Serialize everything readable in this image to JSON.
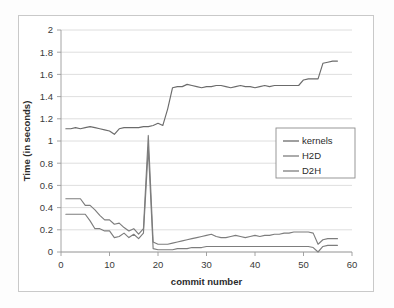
{
  "chart_data": {
    "type": "line",
    "title": "",
    "xlabel": "commit number",
    "ylabel": "Time (in seconds)",
    "xlim": [
      0,
      60
    ],
    "ylim": [
      0,
      2
    ],
    "xticks": [
      0,
      10,
      20,
      30,
      40,
      50,
      60
    ],
    "yticks": [
      0,
      0.2,
      0.4,
      0.6,
      0.8,
      1,
      1.2,
      1.4,
      1.6,
      1.8,
      2
    ],
    "xtick_labels": [
      "0",
      "10",
      "20",
      "30",
      "40",
      "50",
      "60"
    ],
    "ytick_labels": [
      "0",
      "0.2",
      "0.4",
      "0.6",
      "0.8",
      "1",
      "1.2",
      "1.4",
      "1.6",
      "1.8",
      "2"
    ],
    "grid": "horizontal",
    "legend_position": "center-right",
    "x": [
      1,
      2,
      3,
      4,
      5,
      6,
      7,
      8,
      9,
      10,
      11,
      12,
      13,
      14,
      15,
      16,
      17,
      18,
      19,
      20,
      21,
      22,
      23,
      24,
      25,
      26,
      27,
      28,
      29,
      30,
      31,
      32,
      33,
      34,
      35,
      36,
      37,
      38,
      39,
      40,
      41,
      42,
      43,
      44,
      45,
      46,
      47,
      48,
      49,
      50,
      51,
      52,
      53,
      54,
      55,
      56,
      57
    ],
    "series": [
      {
        "name": "kernels",
        "color": "#6b6b6b",
        "values": [
          1.11,
          1.11,
          1.12,
          1.11,
          1.12,
          1.13,
          1.12,
          1.11,
          1.1,
          1.09,
          1.06,
          1.11,
          1.12,
          1.12,
          1.12,
          1.12,
          1.13,
          1.13,
          1.14,
          1.16,
          1.14,
          1.29,
          1.48,
          1.49,
          1.49,
          1.51,
          1.5,
          1.49,
          1.48,
          1.49,
          1.49,
          1.5,
          1.5,
          1.49,
          1.48,
          1.49,
          1.5,
          1.49,
          1.49,
          1.48,
          1.49,
          1.5,
          1.49,
          1.5,
          1.5,
          1.5,
          1.5,
          1.5,
          1.5,
          1.55,
          1.56,
          1.56,
          1.56,
          1.7,
          1.71,
          1.72,
          1.72
        ]
      },
      {
        "name": "H2D",
        "color": "#7d7d7d",
        "values": [
          0.48,
          0.48,
          0.48,
          0.48,
          0.42,
          0.42,
          0.38,
          0.33,
          0.29,
          0.29,
          0.25,
          0.26,
          0.22,
          0.19,
          0.21,
          0.16,
          0.21,
          1.05,
          0.09,
          0.07,
          0.07,
          0.07,
          0.08,
          0.09,
          0.1,
          0.11,
          0.12,
          0.13,
          0.14,
          0.15,
          0.16,
          0.14,
          0.13,
          0.13,
          0.14,
          0.15,
          0.14,
          0.13,
          0.14,
          0.15,
          0.14,
          0.15,
          0.15,
          0.16,
          0.16,
          0.17,
          0.17,
          0.18,
          0.18,
          0.18,
          0.18,
          0.17,
          0.07,
          0.11,
          0.12,
          0.12,
          0.12
        ]
      },
      {
        "name": "D2H",
        "color": "#7d7d7d",
        "values": [
          0.34,
          0.34,
          0.34,
          0.34,
          0.34,
          0.28,
          0.21,
          0.21,
          0.19,
          0.19,
          0.13,
          0.14,
          0.17,
          0.13,
          0.16,
          0.12,
          0.17,
          0.94,
          0.03,
          0.02,
          0.02,
          0.02,
          0.02,
          0.03,
          0.03,
          0.03,
          0.04,
          0.04,
          0.04,
          0.05,
          0.05,
          0.05,
          0.05,
          0.05,
          0.05,
          0.05,
          0.05,
          0.05,
          0.05,
          0.05,
          0.05,
          0.05,
          0.05,
          0.05,
          0.05,
          0.05,
          0.05,
          0.05,
          0.05,
          0.05,
          0.05,
          0.04,
          0.0,
          0.05,
          0.06,
          0.06,
          0.06
        ]
      }
    ]
  },
  "legend": {
    "items": [
      {
        "label": "kernels"
      },
      {
        "label": "H2D"
      },
      {
        "label": "D2H"
      }
    ]
  },
  "colors": {
    "line_gray": "#6b6b6b",
    "grid_gray": "#d6d6d6",
    "axis_gray": "#9a9a9a",
    "frame_gray": "#c9c9c9"
  }
}
